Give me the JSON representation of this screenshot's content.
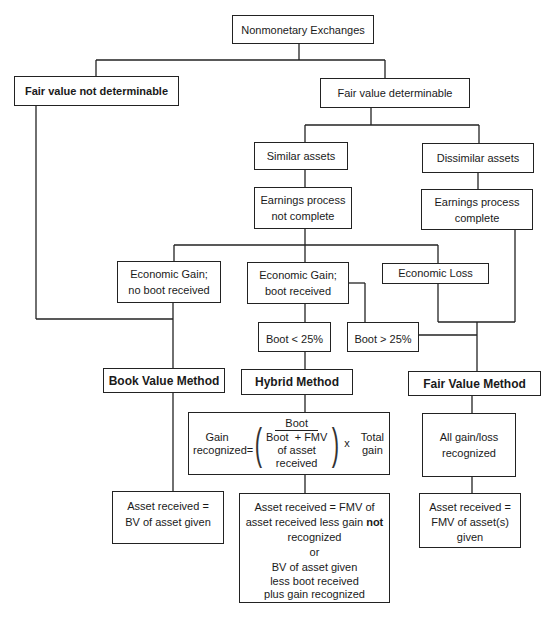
{
  "diagram": {
    "title": "Nonmonetary Exchanges",
    "nodes": {
      "root": "Nonmonetary Exchanges",
      "fv_not_determinable": {
        "pre": "Fair value ",
        "bold": "not",
        "post": " determinable"
      },
      "fv_determinable": "Fair value determinable",
      "similar_assets": "Similar assets",
      "dissimilar_assets": "Dissimilar assets",
      "earnings_not_complete": [
        "Earnings process",
        "not complete"
      ],
      "earnings_complete": [
        "Earnings process",
        "complete"
      ],
      "gain_no_boot": [
        "Economic Gain;",
        "no boot received"
      ],
      "gain_boot": [
        "Economic Gain;",
        "boot received"
      ],
      "economic_loss": "Economic Loss",
      "boot_lt_25": "Boot < 25%",
      "boot_gt_25": "Boot > 25%",
      "book_value_method": "Book Value Method",
      "hybrid_method": "Hybrid Method",
      "fair_value_method": "Fair Value Method",
      "formula": {
        "left": [
          "Gain",
          "recognized="
        ],
        "numerator": "Boot",
        "denominator": [
          "Boot  + FMV",
          "of asset",
          "received"
        ],
        "times": "x",
        "right": [
          "Total",
          "gain"
        ]
      },
      "all_gain_loss": [
        "All gain/loss",
        "recognized"
      ],
      "bv_result": [
        "Asset received =",
        "BV of asset given"
      ],
      "hybrid_result": {
        "line1": "Asset received = FMV of",
        "line2_pre": "asset received less gain ",
        "line2_bold": "not",
        "line3": "recognized",
        "line4": "or",
        "line5": "BV of asset given",
        "line6": "less boot received",
        "line7": "plus gain recognized"
      },
      "fmv_result": [
        "Asset received =",
        "FMV of asset(s)",
        "given"
      ]
    }
  }
}
